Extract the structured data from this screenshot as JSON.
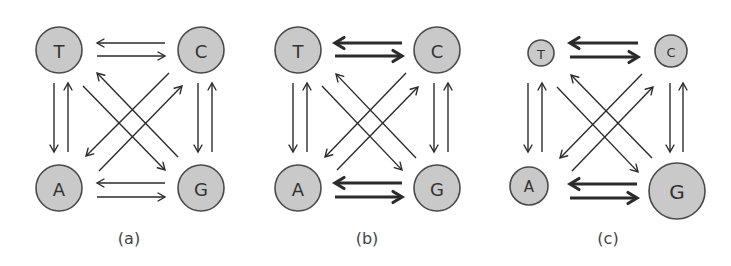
{
  "figure": {
    "colors": {
      "node_fill": "#c9c9c9",
      "node_stroke": "#4a4a4a",
      "arrow": "#2b2b2b",
      "label": "#444444"
    },
    "panels": [
      {
        "id": "a",
        "label": "(a)",
        "label_pos": [
          129,
          238
        ],
        "nodes": [
          {
            "name": "T",
            "x": 59,
            "y": 50,
            "r": 23
          },
          {
            "name": "C",
            "x": 201,
            "y": 50,
            "r": 23
          },
          {
            "name": "A",
            "x": 59,
            "y": 188,
            "r": 23
          },
          {
            "name": "G",
            "x": 201,
            "y": 188,
            "r": 23
          }
        ],
        "edges": [
          {
            "from": "C",
            "to": "T",
            "x1": 165,
            "y1": 43,
            "x2": 97,
            "y2": 43,
            "weight": "thin"
          },
          {
            "from": "T",
            "to": "C",
            "x1": 97,
            "y1": 56,
            "x2": 165,
            "y2": 56,
            "weight": "thin"
          },
          {
            "from": "G",
            "to": "A",
            "x1": 165,
            "y1": 183,
            "x2": 97,
            "y2": 183,
            "weight": "thin"
          },
          {
            "from": "A",
            "to": "G",
            "x1": 97,
            "y1": 197,
            "x2": 165,
            "y2": 197,
            "weight": "thin"
          },
          {
            "from": "T",
            "to": "A",
            "x1": 54,
            "y1": 83,
            "x2": 54,
            "y2": 152,
            "weight": "thin"
          },
          {
            "from": "A",
            "to": "T",
            "x1": 68,
            "y1": 152,
            "x2": 68,
            "y2": 83,
            "weight": "thin"
          },
          {
            "from": "C",
            "to": "G",
            "x1": 198,
            "y1": 83,
            "x2": 198,
            "y2": 152,
            "weight": "thin"
          },
          {
            "from": "G",
            "to": "C",
            "x1": 212,
            "y1": 152,
            "x2": 212,
            "y2": 83,
            "weight": "thin"
          },
          {
            "from": "T",
            "to": "G",
            "x1": 83,
            "y1": 86,
            "x2": 165,
            "y2": 170,
            "weight": "thin"
          },
          {
            "from": "G",
            "to": "T",
            "x1": 178,
            "y1": 157,
            "x2": 97,
            "y2": 73,
            "weight": "thin"
          },
          {
            "from": "C",
            "to": "A",
            "x1": 169,
            "y1": 73,
            "x2": 86,
            "y2": 156,
            "weight": "thin"
          },
          {
            "from": "A",
            "to": "C",
            "x1": 99,
            "y1": 171,
            "x2": 182,
            "y2": 86,
            "weight": "thin"
          }
        ]
      },
      {
        "id": "b",
        "label": "(b)",
        "label_pos": [
          367,
          238
        ],
        "nodes": [
          {
            "name": "T",
            "x": 298,
            "y": 50,
            "r": 23
          },
          {
            "name": "C",
            "x": 437,
            "y": 50,
            "r": 23
          },
          {
            "name": "A",
            "x": 298,
            "y": 188,
            "r": 23
          },
          {
            "name": "G",
            "x": 437,
            "y": 188,
            "r": 23
          }
        ],
        "edges": [
          {
            "from": "C",
            "to": "T",
            "x1": 402,
            "y1": 43,
            "x2": 335,
            "y2": 43,
            "weight": "thick"
          },
          {
            "from": "T",
            "to": "C",
            "x1": 335,
            "y1": 56,
            "x2": 402,
            "y2": 56,
            "weight": "thick"
          },
          {
            "from": "G",
            "to": "A",
            "x1": 402,
            "y1": 183,
            "x2": 335,
            "y2": 183,
            "weight": "thick"
          },
          {
            "from": "A",
            "to": "G",
            "x1": 335,
            "y1": 197,
            "x2": 402,
            "y2": 197,
            "weight": "thick"
          },
          {
            "from": "T",
            "to": "A",
            "x1": 293,
            "y1": 83,
            "x2": 293,
            "y2": 152,
            "weight": "thin"
          },
          {
            "from": "A",
            "to": "T",
            "x1": 307,
            "y1": 152,
            "x2": 307,
            "y2": 83,
            "weight": "thin"
          },
          {
            "from": "C",
            "to": "G",
            "x1": 434,
            "y1": 83,
            "x2": 434,
            "y2": 152,
            "weight": "thin"
          },
          {
            "from": "G",
            "to": "C",
            "x1": 448,
            "y1": 152,
            "x2": 448,
            "y2": 83,
            "weight": "thin"
          },
          {
            "from": "T",
            "to": "G",
            "x1": 322,
            "y1": 86,
            "x2": 402,
            "y2": 170,
            "weight": "thin"
          },
          {
            "from": "G",
            "to": "T",
            "x1": 416,
            "y1": 158,
            "x2": 336,
            "y2": 74,
            "weight": "thin"
          },
          {
            "from": "C",
            "to": "A",
            "x1": 406,
            "y1": 73,
            "x2": 325,
            "y2": 157,
            "weight": "thin"
          },
          {
            "from": "A",
            "to": "C",
            "x1": 337,
            "y1": 170,
            "x2": 418,
            "y2": 87,
            "weight": "thin"
          }
        ]
      },
      {
        "id": "c",
        "label": "(c)",
        "label_pos": [
          608,
          238
        ],
        "nodes": [
          {
            "name": "T",
            "x": 541,
            "y": 53,
            "r": 13
          },
          {
            "name": "C",
            "x": 671,
            "y": 51,
            "r": 16
          },
          {
            "name": "A",
            "x": 529,
            "y": 186,
            "r": 19
          },
          {
            "name": "G",
            "x": 677,
            "y": 191,
            "r": 28
          }
        ],
        "edges": [
          {
            "from": "C",
            "to": "T",
            "x1": 638,
            "y1": 43,
            "x2": 570,
            "y2": 43,
            "weight": "thick"
          },
          {
            "from": "T",
            "to": "C",
            "x1": 570,
            "y1": 57,
            "x2": 638,
            "y2": 57,
            "weight": "thick"
          },
          {
            "from": "G",
            "to": "A",
            "x1": 637,
            "y1": 184,
            "x2": 570,
            "y2": 184,
            "weight": "thick"
          },
          {
            "from": "A",
            "to": "G",
            "x1": 570,
            "y1": 198,
            "x2": 637,
            "y2": 198,
            "weight": "thick"
          },
          {
            "from": "T",
            "to": "A",
            "x1": 528,
            "y1": 83,
            "x2": 528,
            "y2": 152,
            "weight": "thin"
          },
          {
            "from": "A",
            "to": "T",
            "x1": 542,
            "y1": 152,
            "x2": 542,
            "y2": 83,
            "weight": "thin"
          },
          {
            "from": "C",
            "to": "G",
            "x1": 670,
            "y1": 83,
            "x2": 670,
            "y2": 152,
            "weight": "thin"
          },
          {
            "from": "G",
            "to": "C",
            "x1": 683,
            "y1": 152,
            "x2": 683,
            "y2": 83,
            "weight": "thin"
          },
          {
            "from": "T",
            "to": "G",
            "x1": 557,
            "y1": 87,
            "x2": 638,
            "y2": 172,
            "weight": "thin"
          },
          {
            "from": "G",
            "to": "T",
            "x1": 652,
            "y1": 158,
            "x2": 571,
            "y2": 75,
            "weight": "thin"
          },
          {
            "from": "C",
            "to": "A",
            "x1": 642,
            "y1": 74,
            "x2": 560,
            "y2": 158,
            "weight": "thin"
          },
          {
            "from": "A",
            "to": "C",
            "x1": 572,
            "y1": 171,
            "x2": 653,
            "y2": 87,
            "weight": "thin"
          }
        ]
      }
    ]
  }
}
